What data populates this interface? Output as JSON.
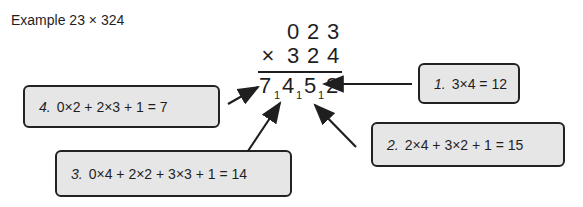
{
  "title": "Example 23 × 324",
  "multiplication": {
    "top_row": [
      "0",
      "2",
      "3"
    ],
    "times_sign": "×",
    "bottom_row": [
      "3",
      "2",
      "4"
    ],
    "result_digits": [
      "7",
      "4",
      "5",
      "2"
    ],
    "carries": [
      "1",
      "1",
      "1"
    ]
  },
  "steps": [
    {
      "number": "1.",
      "expression": "3×4 = 12"
    },
    {
      "number": "2.",
      "expression": "2×4 + 3×2 + 1 = 15"
    },
    {
      "number": "3.",
      "expression": "0×4 + 2×2 + 3×3 + 1 = 14"
    },
    {
      "number": "4.",
      "expression": "0×2 + 2×3 + 1 = 7"
    }
  ],
  "colors": {
    "box_fill": "#e6e6e6",
    "ink": "#1f1f1f"
  }
}
